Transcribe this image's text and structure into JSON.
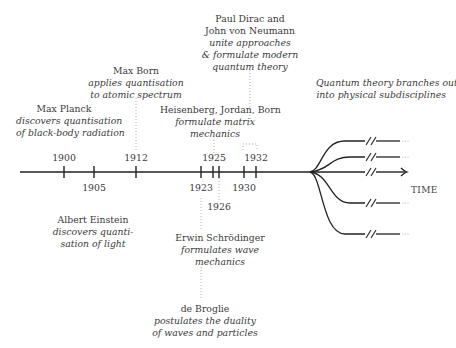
{
  "diagram": {
    "title": "",
    "axis_label": "TIME",
    "years_above": [
      {
        "label": "1900",
        "x": 64
      },
      {
        "label": "1912",
        "x": 136
      },
      {
        "label": "1925",
        "x": 216
      },
      {
        "label": "1932",
        "x": 256
      }
    ],
    "years_below": [
      {
        "label": "1905",
        "x": 94
      },
      {
        "label": "1923",
        "x": 201
      },
      {
        "label": "1926",
        "x": 219
      },
      {
        "label": "1930",
        "x": 244
      }
    ],
    "events": [
      {
        "id": "planck",
        "name": "Max Planck",
        "desc": [
          "discovers quantisation",
          "of black-body radiation"
        ],
        "year": "1900"
      },
      {
        "id": "born",
        "name": "Max Born",
        "desc": [
          "applies quantisation",
          "to atomic spectrum"
        ],
        "year": "1912"
      },
      {
        "id": "dirac",
        "name": [
          "Paul Dirac and",
          "John von Neumann"
        ],
        "desc": [
          "unite approaches",
          "& formulate modern",
          "quantum theory"
        ],
        "year": "1932"
      },
      {
        "id": "heisenberg",
        "name": "Heisenberg, Jordan, Born",
        "desc": [
          "formulate matrix",
          "mechanics"
        ],
        "year": "1925"
      },
      {
        "id": "einstein",
        "name": "Albert Einstein",
        "desc": [
          "discovers quanti-",
          "sation of light"
        ],
        "year": "1905"
      },
      {
        "id": "schrodinger",
        "name": "Erwin Schrödinger",
        "desc": [
          "formulates wave",
          "mechanics"
        ],
        "year": "1926"
      },
      {
        "id": "debroglie",
        "name": "de Broglie",
        "desc": [
          "postulates the duality",
          "of waves and particles"
        ],
        "year": "1923"
      },
      {
        "id": "branches",
        "name": "",
        "desc": [
          "Quantum theory branches out",
          "into physical subdisciplines"
        ],
        "year": ""
      }
    ],
    "branch_count": 5
  }
}
